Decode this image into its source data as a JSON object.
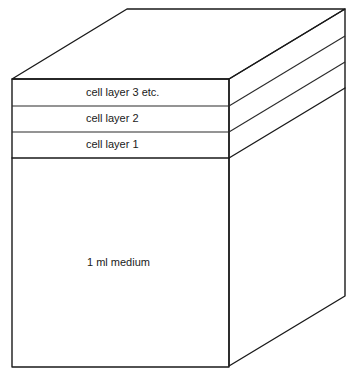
{
  "diagram": {
    "title": "",
    "colors": {
      "line": "#1a1a1a",
      "background": "#ffffff"
    },
    "layers": [
      {
        "id": "cell-layer-3",
        "label": "cell layer 3 etc."
      },
      {
        "id": "cell-layer-2",
        "label": "cell layer 2"
      },
      {
        "id": "cell-layer-1",
        "label": "cell layer 1"
      },
      {
        "id": "medium",
        "label": "1 ml medium"
      }
    ]
  }
}
